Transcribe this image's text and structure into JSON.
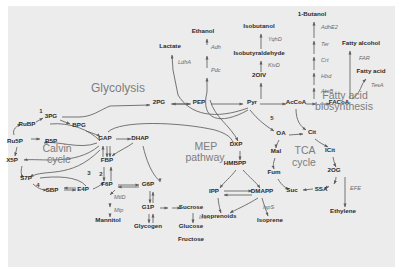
{
  "diagram": {
    "title_labels": [
      {
        "id": "glycolysis",
        "text": "Glycolysis",
        "x": 118,
        "y": 92,
        "size": "big"
      },
      {
        "id": "calvin1",
        "text": "Calvin",
        "x": 57,
        "y": 152,
        "size": "mid"
      },
      {
        "id": "calvin2",
        "text": "cycle",
        "x": 59,
        "y": 163,
        "size": "mid"
      },
      {
        "id": "mep1",
        "text": "MEP",
        "x": 206,
        "y": 150,
        "size": "mid"
      },
      {
        "id": "mep2",
        "text": "pathway",
        "x": 205,
        "y": 161,
        "size": "mid"
      },
      {
        "id": "tca1",
        "text": "TCA",
        "x": 305,
        "y": 154,
        "size": "mid"
      },
      {
        "id": "tca2",
        "text": "cycle",
        "x": 304,
        "y": 166,
        "size": "mid"
      },
      {
        "id": "fab1",
        "text": "Fatty acid",
        "x": 345,
        "y": 99,
        "size": "mid"
      },
      {
        "id": "fab2",
        "text": "biosynthesis",
        "x": 344,
        "y": 110,
        "size": "mid"
      }
    ],
    "metabolites": [
      {
        "id": "lactate",
        "text": "Lactate",
        "x": 170,
        "y": 48
      },
      {
        "id": "ethanol",
        "text": "Ethanol",
        "x": 203,
        "y": 33
      },
      {
        "id": "isobutanol",
        "text": "Isobutanol",
        "x": 259,
        "y": 28
      },
      {
        "id": "isobutyraldehyde",
        "text": "Isobutyraldehyde",
        "x": 259,
        "y": 55
      },
      {
        "id": "2oiv",
        "text": "2OIV",
        "x": 259,
        "y": 77
      },
      {
        "id": "butanol1",
        "text": "1-Butanol",
        "x": 312,
        "y": 16
      },
      {
        "id": "fattyalcohol",
        "text": "Fatty alcohol",
        "x": 361,
        "y": 45
      },
      {
        "id": "fattyacid",
        "text": "Fatty acid",
        "x": 371,
        "y": 73
      },
      {
        "id": "2pg",
        "text": "2PG",
        "x": 159,
        "y": 104
      },
      {
        "id": "pep",
        "text": "PEP",
        "x": 199,
        "y": 104
      },
      {
        "id": "pyr",
        "text": "Pyr",
        "x": 252,
        "y": 104
      },
      {
        "id": "accoa",
        "text": "AcCoA",
        "x": 296,
        "y": 104
      },
      {
        "id": "facoa",
        "text": "FACoA",
        "x": 339,
        "y": 104
      },
      {
        "id": "3pg",
        "text": "3PG",
        "x": 51,
        "y": 118
      },
      {
        "id": "rubp",
        "text": "RuBP",
        "x": 27,
        "y": 126
      },
      {
        "id": "bpg",
        "text": "BPG",
        "x": 79,
        "y": 127
      },
      {
        "id": "gap",
        "text": "GAP",
        "x": 105,
        "y": 140
      },
      {
        "id": "dhap",
        "text": "DHAP",
        "x": 140,
        "y": 140
      },
      {
        "id": "dxp",
        "text": "DXP",
        "x": 236,
        "y": 146
      },
      {
        "id": "oa",
        "text": "OA",
        "x": 281,
        "y": 135
      },
      {
        "id": "cit",
        "text": "Cit",
        "x": 312,
        "y": 134
      },
      {
        "id": "ru5p",
        "text": "Ru5P",
        "x": 15,
        "y": 143
      },
      {
        "id": "r5p",
        "text": "R5P",
        "x": 51,
        "y": 143
      },
      {
        "id": "mal",
        "text": "Mal",
        "x": 276,
        "y": 153
      },
      {
        "id": "icit",
        "text": "ICit",
        "x": 330,
        "y": 152
      },
      {
        "id": "x5p",
        "text": "X5P",
        "x": 12,
        "y": 162
      },
      {
        "id": "fbp",
        "text": "FBP",
        "x": 107,
        "y": 162
      },
      {
        "id": "hmbpp",
        "text": "HMBPP",
        "x": 235,
        "y": 165
      },
      {
        "id": "fum",
        "text": "Fum",
        "x": 274,
        "y": 174
      },
      {
        "id": "2og",
        "text": "2OG",
        "x": 334,
        "y": 172
      },
      {
        "id": "s7p",
        "text": "S7P",
        "x": 26,
        "y": 180
      },
      {
        "id": "f6p",
        "text": "F6P",
        "x": 107,
        "y": 186
      },
      {
        "id": "g6p",
        "text": "G6P",
        "x": 148,
        "y": 186
      },
      {
        "id": "sbp",
        "text": "SBP",
        "x": 52,
        "y": 192
      },
      {
        "id": "e4p",
        "text": "E4P",
        "x": 83,
        "y": 191
      },
      {
        "id": "ipp",
        "text": "IPP",
        "x": 214,
        "y": 193
      },
      {
        "id": "dmapp",
        "text": "DMAPP",
        "x": 262,
        "y": 193
      },
      {
        "id": "suc",
        "text": "Suc",
        "x": 292,
        "y": 192
      },
      {
        "id": "ssa",
        "text": "SSA",
        "x": 321,
        "y": 191
      },
      {
        "id": "g1p",
        "text": "G1P",
        "x": 148,
        "y": 209
      },
      {
        "id": "sucrose",
        "text": "Sucrose",
        "x": 191,
        "y": 209
      },
      {
        "id": "isoprenoids",
        "text": "Isoprenoids",
        "x": 219,
        "y": 218
      },
      {
        "id": "isoprene",
        "text": "Isoprene",
        "x": 270,
        "y": 222
      },
      {
        "id": "ethylene",
        "text": "Ethylene",
        "x": 343,
        "y": 213
      },
      {
        "id": "mannitol",
        "text": "Mannitol",
        "x": 108,
        "y": 222
      },
      {
        "id": "glycogen",
        "text": "Glycogen",
        "x": 148,
        "y": 228
      },
      {
        "id": "glucose",
        "text": "Glucose",
        "x": 191,
        "y": 228
      },
      {
        "id": "fructose",
        "text": "Fructose",
        "x": 191,
        "y": 241
      }
    ],
    "enzymes": [
      {
        "id": "ldha",
        "text": "LdhA",
        "x": 178,
        "y": 64
      },
      {
        "id": "adh",
        "text": "Adh",
        "x": 211,
        "y": 49
      },
      {
        "id": "pdc",
        "text": "Pdc",
        "x": 211,
        "y": 72
      },
      {
        "id": "yqhd",
        "text": "YqhD",
        "x": 268,
        "y": 41
      },
      {
        "id": "kivd",
        "text": "KivD",
        "x": 268,
        "y": 67
      },
      {
        "id": "adhe2",
        "text": "AdhE2",
        "x": 321,
        "y": 29
      },
      {
        "id": "ter",
        "text": "Ter",
        "x": 321,
        "y": 46
      },
      {
        "id": "crt",
        "text": "Crt",
        "x": 321,
        "y": 62
      },
      {
        "id": "hbd",
        "text": "Hbd",
        "x": 321,
        "y": 78
      },
      {
        "id": "atob",
        "text": "AtoB",
        "x": 321,
        "y": 93
      },
      {
        "id": "far",
        "text": "FAR",
        "x": 359,
        "y": 60
      },
      {
        "id": "tesa",
        "text": "TesA",
        "x": 371,
        "y": 87
      },
      {
        "id": "mtld",
        "text": "MtlD",
        "x": 114,
        "y": 199
      },
      {
        "id": "mtp",
        "text": "Mtp",
        "x": 114,
        "y": 212
      },
      {
        "id": "inva",
        "text": "InvA",
        "x": 199,
        "y": 219
      },
      {
        "id": "isps",
        "text": "IspS",
        "x": 263,
        "y": 209
      },
      {
        "id": "efe",
        "text": "EFE",
        "x": 350,
        "y": 190
      }
    ],
    "step_numbers": [
      {
        "id": "step1",
        "text": "1",
        "x": 41,
        "y": 113
      },
      {
        "id": "step2",
        "text": "2",
        "x": 101,
        "y": 176
      },
      {
        "id": "step3",
        "text": "3",
        "x": 89,
        "y": 175
      },
      {
        "id": "step4",
        "text": "4",
        "x": 38,
        "y": 187
      },
      {
        "id": "step5",
        "text": "5",
        "x": 272,
        "y": 120
      }
    ],
    "colors": {
      "panel_background": "#ececec",
      "page_background": "#ffffff",
      "node_text": "#2b2b2b",
      "enzyme_text": "#6a6a6a",
      "pathway_label": "#7d7d7d",
      "edge": "#5e5e5e"
    }
  }
}
